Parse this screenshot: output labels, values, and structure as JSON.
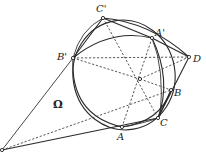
{
  "diagram": {
    "title": "",
    "points": {
      "C_prime": {
        "label": "C'",
        "x": 103,
        "y": 18,
        "lx": 96,
        "ly": 12
      },
      "A_prime": {
        "label": "A'",
        "x": 152,
        "y": 38,
        "lx": 155,
        "ly": 36
      },
      "D": {
        "label": "D",
        "x": 189,
        "y": 57,
        "lx": 193,
        "ly": 62
      },
      "B_prime": {
        "label": "B'",
        "x": 73,
        "y": 58,
        "lx": 57,
        "ly": 60
      },
      "O": {
        "label": "",
        "x": 140,
        "y": 79
      },
      "B": {
        "label": "B",
        "x": 171,
        "y": 90,
        "lx": 174,
        "ly": 96
      },
      "C": {
        "label": "C",
        "x": 158,
        "y": 118,
        "lx": 160,
        "ly": 126
      },
      "A": {
        "label": "A",
        "x": 122,
        "y": 127,
        "lx": 117,
        "ly": 140
      },
      "P": {
        "label": "",
        "x": 2,
        "y": 150
      }
    },
    "circle_label": {
      "label": "Ω",
      "x": 53,
      "y": 108
    },
    "colors": {
      "stroke": "#2a2a2a",
      "background": "#ffffff"
    }
  }
}
